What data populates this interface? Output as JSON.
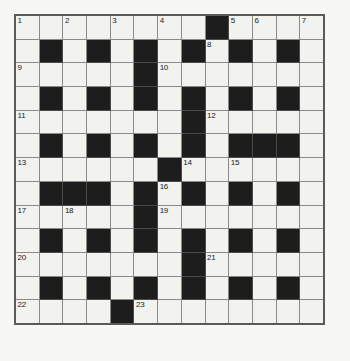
{
  "puzzle": {
    "title": "Crossword Grid",
    "type": "crossword",
    "rows": 13,
    "cols": 13,
    "colors": {
      "background": "#f7f7f5",
      "cell_white": "#f2f2ee",
      "cell_black": "#1d1d1d",
      "grid_line": "#8a8a8a",
      "border": "#5a5a5a",
      "number_text": "#1a1a1a"
    },
    "numbers_visible": [
      1,
      2,
      3,
      4,
      5,
      6,
      7,
      8,
      9,
      10,
      11,
      12,
      13,
      14,
      15,
      16,
      17,
      18,
      19,
      20,
      21,
      22,
      23
    ],
    "grid": [
      [
        {
          "black": false,
          "num": "1"
        },
        {
          "black": false,
          "num": ""
        },
        {
          "black": false,
          "num": "2"
        },
        {
          "black": false,
          "num": ""
        },
        {
          "black": false,
          "num": "3"
        },
        {
          "black": false,
          "num": ""
        },
        {
          "black": false,
          "num": "4"
        },
        {
          "black": false,
          "num": ""
        },
        {
          "black": true,
          "num": ""
        },
        {
          "black": false,
          "num": "5"
        },
        {
          "black": false,
          "num": "6"
        },
        {
          "black": false,
          "num": ""
        },
        {
          "black": false,
          "num": "7"
        }
      ],
      [
        {
          "black": false,
          "num": ""
        },
        {
          "black": true,
          "num": ""
        },
        {
          "black": false,
          "num": ""
        },
        {
          "black": true,
          "num": ""
        },
        {
          "black": false,
          "num": ""
        },
        {
          "black": true,
          "num": ""
        },
        {
          "black": false,
          "num": ""
        },
        {
          "black": true,
          "num": ""
        },
        {
          "black": false,
          "num": "8"
        },
        {
          "black": true,
          "num": ""
        },
        {
          "black": false,
          "num": ""
        },
        {
          "black": true,
          "num": ""
        },
        {
          "black": false,
          "num": ""
        }
      ],
      [
        {
          "black": false,
          "num": "9"
        },
        {
          "black": false,
          "num": ""
        },
        {
          "black": false,
          "num": ""
        },
        {
          "black": false,
          "num": ""
        },
        {
          "black": false,
          "num": ""
        },
        {
          "black": true,
          "num": ""
        },
        {
          "black": false,
          "num": "10"
        },
        {
          "black": false,
          "num": ""
        },
        {
          "black": false,
          "num": ""
        },
        {
          "black": false,
          "num": ""
        },
        {
          "black": false,
          "num": ""
        },
        {
          "black": false,
          "num": ""
        },
        {
          "black": false,
          "num": ""
        }
      ],
      [
        {
          "black": false,
          "num": ""
        },
        {
          "black": true,
          "num": ""
        },
        {
          "black": false,
          "num": ""
        },
        {
          "black": true,
          "num": ""
        },
        {
          "black": false,
          "num": ""
        },
        {
          "black": true,
          "num": ""
        },
        {
          "black": false,
          "num": ""
        },
        {
          "black": true,
          "num": ""
        },
        {
          "black": false,
          "num": ""
        },
        {
          "black": true,
          "num": ""
        },
        {
          "black": false,
          "num": ""
        },
        {
          "black": true,
          "num": ""
        },
        {
          "black": false,
          "num": ""
        }
      ],
      [
        {
          "black": false,
          "num": "11"
        },
        {
          "black": false,
          "num": ""
        },
        {
          "black": false,
          "num": ""
        },
        {
          "black": false,
          "num": ""
        },
        {
          "black": false,
          "num": ""
        },
        {
          "black": false,
          "num": ""
        },
        {
          "black": false,
          "num": ""
        },
        {
          "black": true,
          "num": ""
        },
        {
          "black": false,
          "num": "12"
        },
        {
          "black": false,
          "num": ""
        },
        {
          "black": false,
          "num": ""
        },
        {
          "black": false,
          "num": ""
        },
        {
          "black": false,
          "num": ""
        }
      ],
      [
        {
          "black": false,
          "num": ""
        },
        {
          "black": true,
          "num": ""
        },
        {
          "black": false,
          "num": ""
        },
        {
          "black": true,
          "num": ""
        },
        {
          "black": false,
          "num": ""
        },
        {
          "black": true,
          "num": ""
        },
        {
          "black": false,
          "num": ""
        },
        {
          "black": true,
          "num": ""
        },
        {
          "black": false,
          "num": ""
        },
        {
          "black": true,
          "num": ""
        },
        {
          "black": true,
          "num": ""
        },
        {
          "black": true,
          "num": ""
        },
        {
          "black": false,
          "num": ""
        }
      ],
      [
        {
          "black": false,
          "num": "13"
        },
        {
          "black": false,
          "num": ""
        },
        {
          "black": false,
          "num": ""
        },
        {
          "black": false,
          "num": ""
        },
        {
          "black": false,
          "num": ""
        },
        {
          "black": false,
          "num": ""
        },
        {
          "black": true,
          "num": ""
        },
        {
          "black": false,
          "num": "14"
        },
        {
          "black": false,
          "num": ""
        },
        {
          "black": false,
          "num": "15"
        },
        {
          "black": false,
          "num": ""
        },
        {
          "black": false,
          "num": ""
        },
        {
          "black": false,
          "num": ""
        }
      ],
      [
        {
          "black": false,
          "num": ""
        },
        {
          "black": true,
          "num": ""
        },
        {
          "black": true,
          "num": ""
        },
        {
          "black": true,
          "num": ""
        },
        {
          "black": false,
          "num": ""
        },
        {
          "black": true,
          "num": ""
        },
        {
          "black": false,
          "num": "16"
        },
        {
          "black": true,
          "num": ""
        },
        {
          "black": false,
          "num": ""
        },
        {
          "black": true,
          "num": ""
        },
        {
          "black": false,
          "num": ""
        },
        {
          "black": true,
          "num": ""
        },
        {
          "black": false,
          "num": ""
        }
      ],
      [
        {
          "black": false,
          "num": "17"
        },
        {
          "black": false,
          "num": ""
        },
        {
          "black": false,
          "num": "18"
        },
        {
          "black": false,
          "num": ""
        },
        {
          "black": false,
          "num": ""
        },
        {
          "black": true,
          "num": ""
        },
        {
          "black": false,
          "num": "19"
        },
        {
          "black": false,
          "num": ""
        },
        {
          "black": false,
          "num": ""
        },
        {
          "black": false,
          "num": ""
        },
        {
          "black": false,
          "num": ""
        },
        {
          "black": false,
          "num": ""
        },
        {
          "black": false,
          "num": ""
        }
      ],
      [
        {
          "black": false,
          "num": ""
        },
        {
          "black": true,
          "num": ""
        },
        {
          "black": false,
          "num": ""
        },
        {
          "black": true,
          "num": ""
        },
        {
          "black": false,
          "num": ""
        },
        {
          "black": true,
          "num": ""
        },
        {
          "black": false,
          "num": ""
        },
        {
          "black": true,
          "num": ""
        },
        {
          "black": false,
          "num": ""
        },
        {
          "black": true,
          "num": ""
        },
        {
          "black": false,
          "num": ""
        },
        {
          "black": true,
          "num": ""
        },
        {
          "black": false,
          "num": ""
        }
      ],
      [
        {
          "black": false,
          "num": "20"
        },
        {
          "black": false,
          "num": ""
        },
        {
          "black": false,
          "num": ""
        },
        {
          "black": false,
          "num": ""
        },
        {
          "black": false,
          "num": ""
        },
        {
          "black": false,
          "num": ""
        },
        {
          "black": false,
          "num": ""
        },
        {
          "black": true,
          "num": ""
        },
        {
          "black": false,
          "num": "21"
        },
        {
          "black": false,
          "num": ""
        },
        {
          "black": false,
          "num": ""
        },
        {
          "black": false,
          "num": ""
        },
        {
          "black": false,
          "num": ""
        }
      ],
      [
        {
          "black": false,
          "num": ""
        },
        {
          "black": true,
          "num": ""
        },
        {
          "black": false,
          "num": ""
        },
        {
          "black": true,
          "num": ""
        },
        {
          "black": false,
          "num": ""
        },
        {
          "black": true,
          "num": ""
        },
        {
          "black": false,
          "num": ""
        },
        {
          "black": true,
          "num": ""
        },
        {
          "black": false,
          "num": ""
        },
        {
          "black": true,
          "num": ""
        },
        {
          "black": false,
          "num": ""
        },
        {
          "black": true,
          "num": ""
        },
        {
          "black": false,
          "num": ""
        }
      ],
      [
        {
          "black": false,
          "num": "22"
        },
        {
          "black": false,
          "num": ""
        },
        {
          "black": false,
          "num": ""
        },
        {
          "black": false,
          "num": ""
        },
        {
          "black": true,
          "num": ""
        },
        {
          "black": false,
          "num": "23"
        },
        {
          "black": false,
          "num": ""
        },
        {
          "black": false,
          "num": ""
        },
        {
          "black": false,
          "num": ""
        },
        {
          "black": false,
          "num": ""
        },
        {
          "black": false,
          "num": ""
        },
        {
          "black": false,
          "num": ""
        },
        {
          "black": false,
          "num": ""
        }
      ]
    ]
  }
}
